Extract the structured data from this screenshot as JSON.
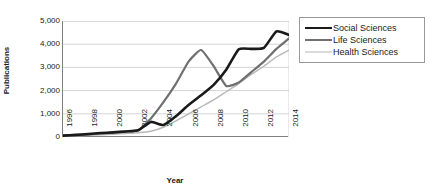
{
  "chart_data": {
    "type": "line",
    "title": "",
    "xlabel": "Year",
    "ylabel": "Publications",
    "xlim": [
      1996,
      2014
    ],
    "ylim": [
      0,
      5000
    ],
    "grid": true,
    "grid_axis": "y",
    "legend_position": "right",
    "x": [
      1996,
      1997,
      1998,
      1999,
      2000,
      2001,
      2002,
      2003,
      2004,
      2005,
      2006,
      2007,
      2008,
      2009,
      2010,
      2011,
      2012,
      2013,
      2014
    ],
    "x_tick_labels": [
      "1996",
      "1998",
      "2000",
      "2002",
      "2004",
      "2006",
      "2008",
      "2010",
      "2012",
      "2014"
    ],
    "x_tick_values": [
      1996,
      1998,
      2000,
      2002,
      2004,
      2006,
      2008,
      2010,
      2012,
      2014
    ],
    "y_tick_labels": [
      "5,000",
      "4,000",
      "3,000",
      "2,000",
      "1,000",
      "0"
    ],
    "y_tick_values": [
      5000,
      4000,
      3000,
      2000,
      1000,
      0
    ],
    "series": [
      {
        "name": "Social Sciences",
        "color": "#1a1a1a",
        "width": 2.6,
        "values": [
          60,
          90,
          130,
          170,
          200,
          240,
          290,
          650,
          520,
          900,
          1380,
          1800,
          2250,
          2900,
          3780,
          3800,
          3840,
          4550,
          4400
        ]
      },
      {
        "name": "Life Sciences",
        "color": "#707070",
        "width": 2.2,
        "values": [
          55,
          80,
          110,
          150,
          190,
          230,
          300,
          800,
          1500,
          2300,
          3250,
          3750,
          3050,
          2200,
          2350,
          2800,
          3250,
          3800,
          4250
        ]
      },
      {
        "name": "Health Sciences",
        "color": "#b8b8b8",
        "width": 1.4,
        "values": [
          40,
          55,
          75,
          95,
          120,
          150,
          185,
          250,
          420,
          700,
          1000,
          1300,
          1600,
          1950,
          2300,
          2700,
          3050,
          3450,
          3750
        ]
      }
    ]
  },
  "legend": {
    "items": [
      {
        "label": "Social Sciences"
      },
      {
        "label": "Life Sciences"
      },
      {
        "label": "Health Sciences"
      }
    ]
  },
  "axes": {
    "y_title": "Publications",
    "x_title": "Year"
  }
}
